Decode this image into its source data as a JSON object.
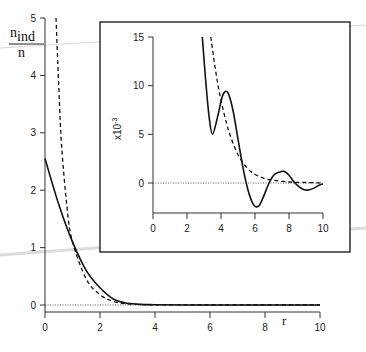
{
  "chart_data": [
    {
      "id": "main",
      "type": "line",
      "title": "",
      "ylabel_numerator": "n",
      "ylabel_numerator_sub": "ind",
      "ylabel_denominator": "n",
      "xlabel": "r",
      "xlim": [
        0,
        10
      ],
      "ylim": [
        0,
        5
      ],
      "xticks": [
        "0",
        "2",
        "4",
        "6",
        "8",
        "10"
      ],
      "yticks": [
        "0",
        "1",
        "2",
        "3",
        "4",
        "5"
      ],
      "grid": false,
      "legend": null,
      "reference_line": {
        "y": 0,
        "style": "dotted"
      },
      "series": [
        {
          "name": "solid",
          "style": "solid",
          "x": [
            0,
            0.5,
            1.0,
            1.5,
            2.0,
            2.5,
            3.0,
            3.5,
            4,
            6,
            8,
            10
          ],
          "y": [
            2.55,
            1.75,
            1.1,
            0.6,
            0.3,
            0.1,
            0.03,
            0.01,
            0.005,
            0.0,
            0.0,
            0.0
          ]
        },
        {
          "name": "dashed",
          "style": "dashed",
          "x": [
            0.4,
            0.5,
            0.6,
            0.8,
            1.0,
            1.5,
            2.0,
            2.5,
            3.0,
            3.5,
            4,
            6,
            10
          ],
          "y": [
            5.2,
            3.8,
            2.8,
            1.7,
            1.1,
            0.45,
            0.18,
            0.06,
            0.02,
            0.008,
            0.003,
            0.0,
            0.0
          ]
        }
      ]
    },
    {
      "id": "inset",
      "type": "line",
      "ylabel": "x10^-3",
      "ylabel_text": "x10",
      "ylabel_exp": "-3",
      "xlim": [
        0,
        10
      ],
      "ylim": [
        -3,
        15
      ],
      "xticks": [
        "0",
        "2",
        "4",
        "6",
        "8",
        "10"
      ],
      "yticks": [
        "0",
        "5",
        "10",
        "15"
      ],
      "grid": false,
      "reference_line": {
        "y": 0,
        "style": "dotted"
      },
      "series": [
        {
          "name": "solid",
          "style": "solid",
          "x": [
            2.9,
            3.1,
            3.3,
            3.5,
            3.8,
            4.1,
            4.4,
            4.7,
            5.0,
            5.3,
            5.6,
            5.9,
            6.2,
            6.5,
            6.8,
            7.1,
            7.4,
            7.7,
            8.0,
            8.3,
            8.6,
            8.9,
            9.2,
            9.5,
            9.8,
            10.0
          ],
          "y": [
            15,
            10.5,
            6.8,
            5.0,
            6.8,
            9.0,
            9.3,
            7.5,
            4.5,
            1.5,
            -0.8,
            -2.2,
            -2.4,
            -1.4,
            -0.1,
            0.8,
            1.1,
            1.2,
            0.8,
            0.1,
            -0.4,
            -0.7,
            -0.7,
            -0.5,
            -0.2,
            -0.1
          ]
        },
        {
          "name": "dashed",
          "style": "dashed",
          "x": [
            3.4,
            3.6,
            3.8,
            4.0,
            4.3,
            4.6,
            5.0,
            5.5,
            6.0,
            6.5,
            7.0,
            8.0,
            9.0,
            10.0
          ],
          "y": [
            15,
            12.5,
            10.3,
            8.5,
            6.3,
            4.6,
            2.9,
            1.6,
            0.9,
            0.5,
            0.3,
            0.1,
            0.05,
            0.0
          ]
        }
      ]
    }
  ]
}
